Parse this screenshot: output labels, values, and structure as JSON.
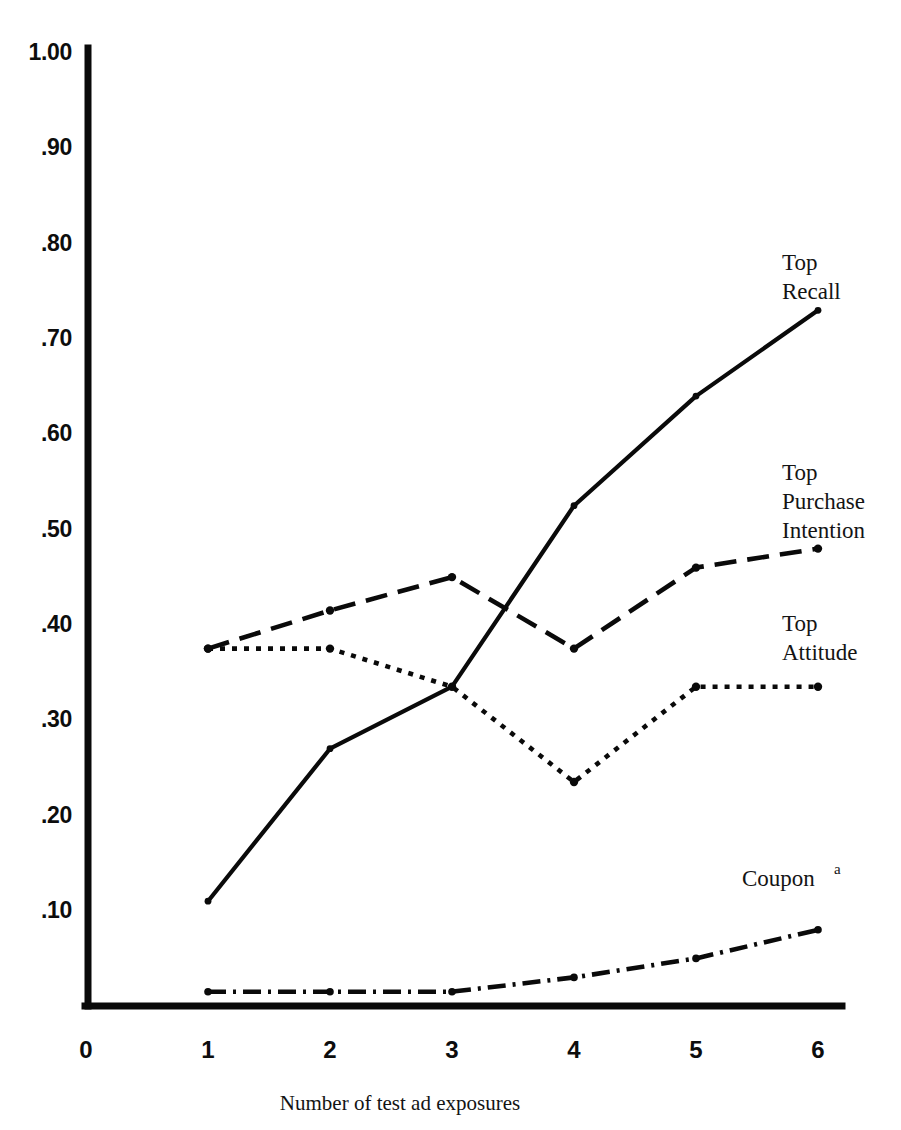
{
  "chart_data": {
    "type": "line",
    "title": "",
    "subtitle": "",
    "xlabel": "Number of test ad exposures",
    "ylabel": "",
    "x": [
      1,
      2,
      3,
      4,
      5,
      6
    ],
    "xlim": [
      0,
      6
    ],
    "ylim": [
      0,
      1.0
    ],
    "grid": false,
    "legend_position": "inline-right-of-series",
    "x_tick_labels": [
      "0",
      "1",
      "2",
      "3",
      "4",
      "5",
      "6"
    ],
    "y_tick_labels": [
      ".10",
      ".20",
      ".30",
      ".40",
      ".50",
      ".60",
      ".70",
      ".80",
      ".90",
      "1.00"
    ],
    "y_tick_values": [
      0.1,
      0.2,
      0.3,
      0.4,
      0.5,
      0.6,
      0.7,
      0.8,
      0.9,
      1.0
    ],
    "series": [
      {
        "name": "Top Recall",
        "label_lines": [
          "Top",
          "Recall"
        ],
        "style": "solid",
        "values": [
          0.11,
          0.27,
          0.335,
          0.525,
          0.64,
          0.73
        ]
      },
      {
        "name": "Top Purchase Intention",
        "label_lines": [
          "Top",
          "Purchase",
          "Intention"
        ],
        "style": "long-dash",
        "values": [
          0.375,
          0.415,
          0.45,
          0.375,
          0.46,
          0.48
        ]
      },
      {
        "name": "Top Attitude",
        "label_lines": [
          "Top",
          "Attitude"
        ],
        "style": "dotted",
        "values": [
          0.375,
          0.375,
          0.335,
          0.235,
          0.335,
          0.335
        ]
      },
      {
        "name": "Coupon",
        "label_lines": [
          "Coupon"
        ],
        "label_superscript": "a",
        "style": "dash-dot",
        "values": [
          0.015,
          0.015,
          0.015,
          0.03,
          0.05,
          0.08
        ]
      }
    ],
    "colors": {
      "ink": "#0a0a0a",
      "background": "#ffffff"
    }
  },
  "axis": {
    "x_title": "Number of test ad exposures"
  },
  "y_ticks": [
    {
      "label": "1.00",
      "value": 1.0
    },
    {
      "label": ".90",
      "value": 0.9
    },
    {
      "label": ".80",
      "value": 0.8
    },
    {
      "label": ".70",
      "value": 0.7
    },
    {
      "label": ".60",
      "value": 0.6
    },
    {
      "label": ".50",
      "value": 0.5
    },
    {
      "label": ".40",
      "value": 0.4
    },
    {
      "label": ".30",
      "value": 0.3
    },
    {
      "label": ".20",
      "value": 0.2
    },
    {
      "label": ".10",
      "value": 0.1
    }
  ],
  "x_ticks": [
    {
      "label": "0",
      "value": 0
    },
    {
      "label": "1",
      "value": 1
    },
    {
      "label": "2",
      "value": 2
    },
    {
      "label": "3",
      "value": 3
    },
    {
      "label": "4",
      "value": 4
    },
    {
      "label": "5",
      "value": 5
    },
    {
      "label": "6",
      "value": 6
    }
  ],
  "series_labels": {
    "recall": {
      "line1": "Top",
      "line2": "Recall"
    },
    "purchase_intention": {
      "line1": "Top",
      "line2": "Purchase",
      "line3": "Intention"
    },
    "attitude": {
      "line1": "Top",
      "line2": "Attitude"
    },
    "coupon": {
      "line1": "Coupon",
      "sup": "a"
    }
  }
}
